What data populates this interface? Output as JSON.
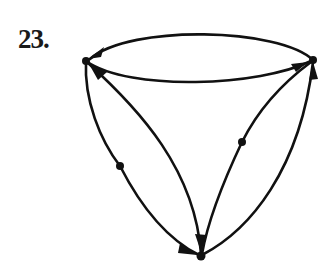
{
  "figure": {
    "label": "23.",
    "type": "directed graph (digraph)",
    "stroke_color": "#111111",
    "background": "#ffffff"
  },
  "graph": {
    "nodes": [
      {
        "id": "left",
        "x": 86,
        "y": 61,
        "role": "vertex"
      },
      {
        "id": "right",
        "x": 313,
        "y": 60,
        "role": "vertex"
      },
      {
        "id": "bottom",
        "x": 201,
        "y": 256,
        "role": "vertex"
      },
      {
        "id": "left-mid",
        "x": 120,
        "y": 166,
        "role": "subdivision vertex"
      },
      {
        "id": "right-mid",
        "x": 242,
        "y": 142,
        "role": "subdivision vertex"
      }
    ],
    "edges": [
      {
        "id": "top-upper-arc",
        "from": "right",
        "to": "left",
        "arrow": "at left end"
      },
      {
        "id": "top-lower-arc",
        "from": "left",
        "to": "right",
        "arrow": "at right end"
      },
      {
        "id": "left-outer-arc",
        "from": "left",
        "to": "bottom",
        "via": "left-mid",
        "arrow": "at bottom end"
      },
      {
        "id": "left-inner-arc",
        "from": "left",
        "to": "bottom",
        "arrow": "both ends"
      },
      {
        "id": "right-inner-arc",
        "from": "right",
        "to": "bottom",
        "via": "right-mid",
        "arrow": "none visible"
      },
      {
        "id": "right-outer-arc",
        "from": "bottom",
        "to": "right",
        "arrow": "at right end"
      }
    ]
  }
}
